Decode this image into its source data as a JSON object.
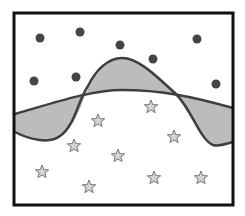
{
  "diagram": {
    "width": 245,
    "height": 216,
    "frame": {
      "x": 14,
      "y": 13,
      "width": 219,
      "height": 192,
      "stroke": "#111111",
      "stroke_width": 3
    },
    "colors": {
      "curve_stroke": "#3f3f3f",
      "shaded_fill": "#bcbcbc",
      "dot_fill": "#454545",
      "star_fill": "#d4d4d4",
      "star_stroke": "#777777"
    },
    "class_a_dots": [
      {
        "x": 40,
        "y": 38
      },
      {
        "x": 80,
        "y": 32
      },
      {
        "x": 120,
        "y": 45
      },
      {
        "x": 34,
        "y": 81
      },
      {
        "x": 76,
        "y": 77
      },
      {
        "x": 153,
        "y": 59
      },
      {
        "x": 197,
        "y": 39
      },
      {
        "x": 216,
        "y": 84
      }
    ],
    "class_b_stars": [
      {
        "x": 151,
        "y": 107
      },
      {
        "x": 98,
        "y": 121
      },
      {
        "x": 174,
        "y": 137
      },
      {
        "x": 74,
        "y": 146
      },
      {
        "x": 118,
        "y": 156
      },
      {
        "x": 42,
        "y": 172
      },
      {
        "x": 154,
        "y": 178
      },
      {
        "x": 201,
        "y": 178
      },
      {
        "x": 89,
        "y": 187
      }
    ],
    "smooth_boundary_path": "M15,114 C50,104 90,90 122,90 C160,90 190,96 233,108",
    "wavy_boundary_path": "M15,132 C30,140 50,144 60,136 C75,126 78,100 88,86 C96,70 108,58 122,58 C140,58 160,80 176,94 C192,110 200,140 213,145 C220,147 228,143 233,142",
    "shaded_regions": [
      "M15,114 C40,106 70,98 86,93 C80,110 72,130 60,136 C50,144 30,140 15,132 Z",
      "M86,93 C94,76 108,58 122,58 C140,58 160,80 176,94 C160,91 140,90 122,90 C105,90 95,91 86,93 Z",
      "M176,94 C195,98 215,103 233,108 L233,142 C228,143 220,147 213,145 C200,140 192,110 176,94 Z"
    ]
  }
}
